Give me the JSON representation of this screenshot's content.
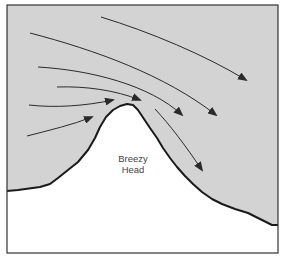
{
  "diagram": {
    "type": "airflow-over-headland",
    "label_line1": "Breezy",
    "label_line2": "Head",
    "colors": {
      "sky": "#d3d3d3",
      "land": "#ffffff",
      "outline": "#1a1a1a",
      "arrows": "#2a2a2a",
      "frame": "#333333"
    },
    "arrows": [
      {
        "id": "wind-arrow-1",
        "path": "M101,17 C150,32 205,55 246,80"
      },
      {
        "id": "wind-arrow-2",
        "path": "M30,33 C95,50 165,75 216,115"
      },
      {
        "id": "wind-arrow-3",
        "path": "M38,67 C90,70 150,85 182,115"
      },
      {
        "id": "wind-arrow-4",
        "path": "M57,87 C85,86 115,90 140,100"
      },
      {
        "id": "wind-arrow-5",
        "path": "M29,105 C55,108 85,106 113,100"
      },
      {
        "id": "wind-arrow-6",
        "path": "M27,136 C50,130 72,125 92,117"
      },
      {
        "id": "wind-arrow-7-leeward",
        "path": "M155,109 C170,125 185,145 202,170"
      }
    ]
  }
}
